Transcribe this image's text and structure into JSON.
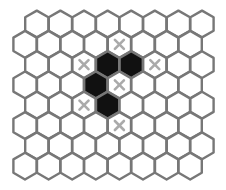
{
  "board": {
    "type": "hex-grid",
    "orientation": "pointy-top",
    "rows": 8,
    "cols": 8,
    "colors": {
      "background": "#ffffff",
      "cell_stroke": "#777777",
      "cell_fill": "#ffffff",
      "dark_fill": "#111111",
      "x_mark": "#aaaaaa"
    },
    "dark_cells": [
      {
        "row": 2,
        "col": 3
      },
      {
        "row": 2,
        "col": 4
      },
      {
        "row": 3,
        "col": 3
      },
      {
        "row": 4,
        "col": 3
      }
    ],
    "x_marks": [
      {
        "row": 1,
        "col": 4
      },
      {
        "row": 2,
        "col": 2
      },
      {
        "row": 2,
        "col": 5
      },
      {
        "row": 3,
        "col": 4
      },
      {
        "row": 4,
        "col": 2
      },
      {
        "row": 5,
        "col": 4
      }
    ]
  }
}
